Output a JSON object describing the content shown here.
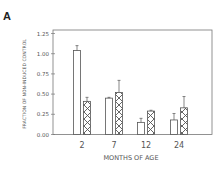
{
  "panel_label": "A",
  "chart_data": {
    "type": "bar",
    "title": "",
    "panel": "A",
    "xlabel": "MONTHS OF AGE",
    "ylabel": "FRACTION OF NON-INDUCED CONTROL",
    "categories": [
      "2",
      "7",
      "12",
      "24"
    ],
    "ylim": [
      0,
      1.25
    ],
    "yticks": [
      "0.00",
      "0.25",
      "0.50",
      "0.75",
      "1.00",
      "1.25"
    ],
    "grid": false,
    "legend": null,
    "series": [
      {
        "name": "open",
        "pattern": "none",
        "values": [
          1.04,
          0.45,
          0.15,
          0.18
        ],
        "error": [
          0.06,
          0.01,
          0.05,
          0.08
        ]
      },
      {
        "name": "hatched",
        "pattern": "crosshatch",
        "values": [
          0.41,
          0.52,
          0.29,
          0.33
        ],
        "error": [
          0.05,
          0.15,
          0.01,
          0.14
        ]
      }
    ]
  },
  "colors": {
    "axis": "#777777",
    "bar_outline": "#555555",
    "bar_fill": "#ffffff",
    "hatch": "#555555",
    "text": "#555555"
  }
}
